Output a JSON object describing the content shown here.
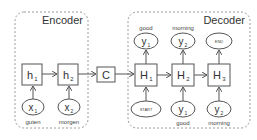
{
  "diagram": {
    "type": "seq2seq encoder-decoder",
    "groups": {
      "encoder": {
        "title": "Encoder"
      },
      "decoder": {
        "title": "Decoder"
      }
    },
    "encoder": {
      "hidden": [
        {
          "base": "h",
          "sub": "1"
        },
        {
          "base": "h",
          "sub": "2"
        }
      ],
      "inputs": [
        {
          "base": "x",
          "sub": "1",
          "token": "guten"
        },
        {
          "base": "x",
          "sub": "2",
          "token": "morgen"
        }
      ]
    },
    "context": {
      "label": "C"
    },
    "decoder": {
      "hidden": [
        {
          "base": "H",
          "sub": "1"
        },
        {
          "base": "H",
          "sub": "2"
        },
        {
          "base": "H",
          "sub": "3"
        }
      ],
      "outputs": [
        {
          "base": "y",
          "sub": "1",
          "token": "good"
        },
        {
          "base": "y",
          "sub": "2",
          "token": "morning"
        },
        {
          "label": "END"
        }
      ],
      "inputs": [
        {
          "label": "START"
        },
        {
          "base": "y",
          "sub": "1",
          "token": "good"
        },
        {
          "base": "y",
          "sub": "2",
          "token": "morning"
        }
      ]
    },
    "colors": {
      "stroke": "#555555",
      "dashed": "#9a9a9a",
      "text": "#333333"
    }
  }
}
